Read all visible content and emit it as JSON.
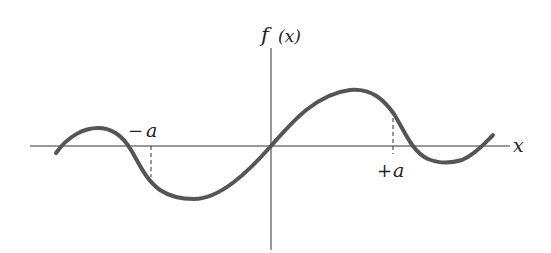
{
  "diagram": {
    "type": "function-plot",
    "axes": {
      "y_label": "f (x)",
      "x_label": "x"
    },
    "markers": [
      {
        "id": "neg-a",
        "label": "−a"
      },
      {
        "id": "pos-a",
        "label": "+a"
      }
    ],
    "colors": {
      "curve": "#555555",
      "axes": "#333333",
      "background": "#ffffff"
    }
  },
  "labels": {
    "f": "f",
    "paren_x": "(x)",
    "x_axis": "x",
    "neg_a_sign": "−",
    "neg_a_letter": "a",
    "pos_a_sign": "+",
    "pos_a_letter": "a"
  }
}
